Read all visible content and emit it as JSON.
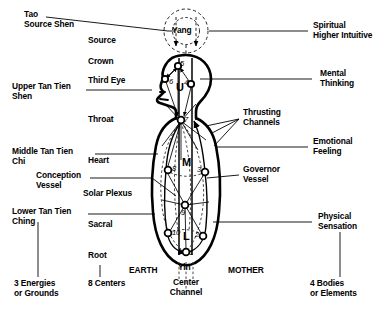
{
  "diagram": {
    "figure": {
      "yang_label": "Yang",
      "yin_label": "Yin",
      "center_channel_label": "Center\nChannel",
      "earth_label": "EARTH",
      "mother_label": "MOTHER",
      "tan_tien_marks": [
        {
          "id": "upper",
          "letter": "U"
        },
        {
          "id": "middle",
          "letter": "M"
        },
        {
          "id": "lower",
          "letter": "L"
        }
      ],
      "centers": [
        {
          "number": "1",
          "name": "root",
          "x": 186,
          "y": 252
        },
        {
          "number": "2",
          "name": "sacral-back",
          "x": 203,
          "y": 236
        },
        {
          "number": "3",
          "name": "mid-back",
          "x": 205,
          "y": 172
        },
        {
          "number": "4",
          "name": "back-head",
          "x": 191,
          "y": 84
        },
        {
          "number": "5",
          "name": "crown",
          "x": 178,
          "y": 66
        },
        {
          "number": "6",
          "name": "third-eye",
          "x": 165,
          "y": 79
        },
        {
          "number": "7",
          "name": "throat",
          "x": 181,
          "y": 120
        },
        {
          "number": "8",
          "name": "heart",
          "x": 168,
          "y": 170
        },
        {
          "number": "9",
          "name": "solar-plexus",
          "x": 185,
          "y": 205
        },
        {
          "number": "10",
          "name": "sacral-front",
          "x": 168,
          "y": 233
        }
      ]
    },
    "left_labels": [
      {
        "id": "tao-source-shen",
        "text": "Tao\nSource Shen",
        "x": 24,
        "y": 14
      },
      {
        "id": "upper-tan-tien",
        "text": "Upper Tan Tien\nShen",
        "x": 12,
        "y": 86
      },
      {
        "id": "middle-tan-tien",
        "text": "Middle Tan Tien\nChi",
        "x": 12,
        "y": 150
      },
      {
        "id": "conception-vessel",
        "text": "Conception\nVessel",
        "x": 36,
        "y": 174
      },
      {
        "id": "lower-tan-tien",
        "text": "Lower Tan Tien\nChing",
        "x": 12,
        "y": 210
      }
    ],
    "center_column_labels": [
      {
        "id": "source",
        "text": "Source",
        "x": 88,
        "y": 40
      },
      {
        "id": "crown",
        "text": "Crown",
        "x": 88,
        "y": 61
      },
      {
        "id": "third-eye",
        "text": "Third Eye",
        "x": 88,
        "y": 80
      },
      {
        "id": "throat",
        "text": "Throat",
        "x": 88,
        "y": 119
      },
      {
        "id": "heart",
        "text": "Heart",
        "x": 88,
        "y": 160
      },
      {
        "id": "solar-plexus",
        "text": "Solar Plexus",
        "x": 83,
        "y": 193
      },
      {
        "id": "sacral",
        "text": "Sacral",
        "x": 88,
        "y": 224
      },
      {
        "id": "root",
        "text": "Root",
        "x": 88,
        "y": 255
      }
    ],
    "right_labels": [
      {
        "id": "spiritual",
        "text": "Spiritual\nHigher Intuitive",
        "x": 313,
        "y": 24
      },
      {
        "id": "mental",
        "text": "Mental\nThinking",
        "x": 320,
        "y": 72
      },
      {
        "id": "thrusting-channels",
        "text": "Thrusting\nChannels",
        "x": 243,
        "y": 112
      },
      {
        "id": "emotional",
        "text": "Emotional\nFeeling",
        "x": 313,
        "y": 140
      },
      {
        "id": "governor-vessel",
        "text": "Governor\nVessel",
        "x": 243,
        "y": 168
      },
      {
        "id": "physical",
        "text": "Physical\nSensation",
        "x": 318,
        "y": 215
      }
    ],
    "bottom_labels": [
      {
        "id": "three-energies",
        "text": "3 Energies\nor Grounds",
        "x": 14,
        "y": 282
      },
      {
        "id": "eight-centers",
        "text": "8 Centers",
        "x": 88,
        "y": 282
      },
      {
        "id": "four-bodies",
        "text": "4 Bodies\nor Elements",
        "x": 310,
        "y": 282
      }
    ],
    "colors": {
      "ink": "#000000",
      "background": "#ffffff",
      "dashed": "#333333"
    }
  }
}
